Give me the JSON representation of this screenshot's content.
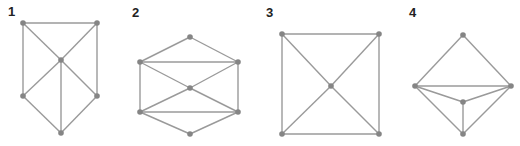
{
  "colors": {
    "edge": "#9a9a9a",
    "vertex": "#858585",
    "label": "#222222"
  },
  "graphs": [
    {
      "label": "1",
      "label_pos": [
        8,
        16
      ],
      "vertices": [
        [
          23,
          23
        ],
        [
          97,
          23
        ],
        [
          61,
          60
        ],
        [
          23,
          96
        ],
        [
          97,
          96
        ],
        [
          61,
          133
        ]
      ],
      "edges": [
        [
          0,
          1
        ],
        [
          0,
          3
        ],
        [
          1,
          4
        ],
        [
          0,
          2
        ],
        [
          1,
          2
        ],
        [
          2,
          3
        ],
        [
          2,
          4
        ],
        [
          2,
          5
        ],
        [
          3,
          5
        ],
        [
          4,
          5
        ]
      ]
    },
    {
      "label": "2",
      "label_pos": [
        132,
        17
      ],
      "vertices": [
        [
          190,
          37
        ],
        [
          140,
          62
        ],
        [
          238,
          62
        ],
        [
          190,
          88
        ],
        [
          140,
          112
        ],
        [
          238,
          112
        ],
        [
          190,
          134
        ]
      ],
      "edges": [
        [
          0,
          1
        ],
        [
          0,
          2
        ],
        [
          1,
          2
        ],
        [
          1,
          4
        ],
        [
          2,
          5
        ],
        [
          1,
          3
        ],
        [
          2,
          3
        ],
        [
          3,
          4
        ],
        [
          3,
          5
        ],
        [
          4,
          5
        ],
        [
          4,
          6
        ],
        [
          5,
          6
        ]
      ]
    },
    {
      "label": "3",
      "label_pos": [
        266,
        17
      ],
      "vertices": [
        [
          282,
          34
        ],
        [
          379,
          34
        ],
        [
          331,
          86
        ],
        [
          282,
          134
        ],
        [
          379,
          134
        ]
      ],
      "edges": [
        [
          0,
          1
        ],
        [
          1,
          4
        ],
        [
          4,
          3
        ],
        [
          3,
          0
        ],
        [
          0,
          2
        ],
        [
          1,
          2
        ],
        [
          2,
          3
        ],
        [
          2,
          4
        ]
      ]
    },
    {
      "label": "4",
      "label_pos": [
        409,
        17
      ],
      "vertices": [
        [
          463,
          35
        ],
        [
          415,
          86
        ],
        [
          511,
          86
        ],
        [
          463,
          102
        ],
        [
          463,
          134
        ]
      ],
      "edges": [
        [
          0,
          1
        ],
        [
          0,
          2
        ],
        [
          1,
          2
        ],
        [
          1,
          3
        ],
        [
          2,
          3
        ],
        [
          3,
          4
        ],
        [
          1,
          4
        ],
        [
          2,
          4
        ]
      ]
    }
  ]
}
